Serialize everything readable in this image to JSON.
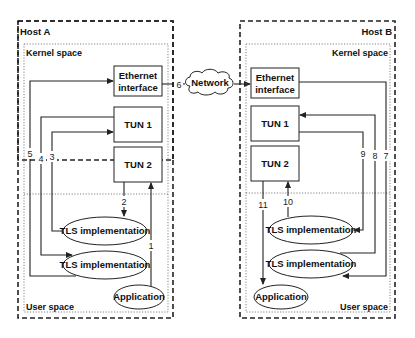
{
  "hosts": {
    "a": {
      "title": "Host A",
      "kernel_label": "Kernel space",
      "user_label": "User space",
      "ethernet": [
        "Ethernet",
        "interface"
      ],
      "tun1": "TUN 1",
      "tun2": "TUN 2",
      "tls_upper": "TLS implementation",
      "tls_lower": "TLS implementation",
      "application": "Application"
    },
    "b": {
      "title": "Host B",
      "kernel_label": "Kernel space",
      "user_label": "User space",
      "ethernet": [
        "Ethernet",
        "interface"
      ],
      "tun1": "TUN 1",
      "tun2": "TUN 2",
      "tls_upper": "TLS implementation",
      "tls_lower": "TLS implementation",
      "application": "Application"
    }
  },
  "network": {
    "label": "Network"
  },
  "flow_numbers": {
    "n1": "1",
    "n2": "2",
    "n3": "3",
    "n4": "4",
    "n5": "5",
    "n6": "6",
    "n7": "7",
    "n8": "8",
    "n9": "9",
    "n10": "10",
    "n11": "11"
  },
  "colors": {
    "stroke": "#222222",
    "background": "#ffffff"
  }
}
